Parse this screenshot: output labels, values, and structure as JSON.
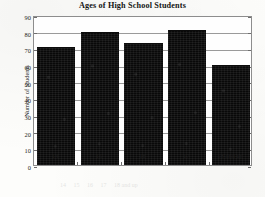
{
  "chart_data": {
    "type": "bar",
    "title": "Ages of High School Students",
    "xlabel": "",
    "ylabel": "Number of Students",
    "categories": [
      "14",
      "15",
      "16",
      "17",
      "18 and up"
    ],
    "values": [
      71,
      80,
      73,
      81,
      60
    ],
    "ylim": [
      0,
      90
    ],
    "ytick_labels": [
      "0",
      "10",
      "20",
      "30",
      "40",
      "50",
      "60",
      "70",
      "80",
      "90"
    ],
    "ytick_values": [
      0,
      10,
      20,
      30,
      40,
      50,
      60,
      70,
      80,
      90
    ],
    "grid": true,
    "legend": false,
    "bar_color": "#090909",
    "axis_color": "#8d8d8d",
    "background": "#fdfdfb"
  }
}
